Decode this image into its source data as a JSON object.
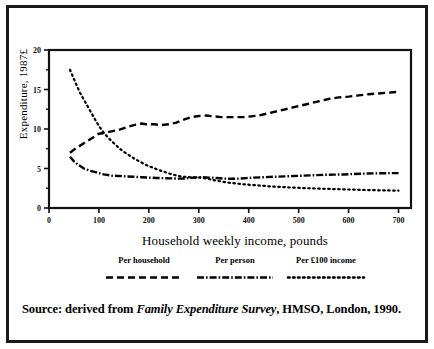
{
  "figure": {
    "source_prefix": "Source: derived from ",
    "source_italic": "Family Expenditure Survey",
    "source_suffix": ", HMSO, London, 1990."
  },
  "legend": {
    "entries": [
      {
        "label": "Per household",
        "dash": "dashed",
        "pattern": "7,4"
      },
      {
        "label": "Per person",
        "dash": "dash-dot",
        "pattern": "7,2,1.6,2"
      },
      {
        "label": "Per £100 income",
        "dash": "dotted",
        "pattern": "1.6,3.4"
      }
    ]
  },
  "chart_data": {
    "type": "line",
    "title": "",
    "xlabel": "Household weekly income, pounds",
    "ylabel": "Expenditure, 1987£",
    "xlim": [
      0,
      725
    ],
    "ylim": [
      0,
      20
    ],
    "grid": false,
    "legend_position": "below-axis",
    "xticks": [
      0,
      100,
      200,
      300,
      400,
      500,
      600,
      700
    ],
    "yticks": [
      0,
      5,
      10,
      15,
      20
    ],
    "yticks_minor": [
      2.5,
      7.5,
      12.5,
      17.5
    ],
    "series": [
      {
        "name": "Per household",
        "style": "dashed",
        "x": [
          42,
          55,
          70,
          85,
          100,
          110,
          125,
          140,
          155,
          170,
          185,
          195,
          210,
          225,
          240,
          255,
          270,
          285,
          300,
          315,
          330,
          345,
          360,
          375,
          390,
          405,
          420,
          440,
          460,
          480,
          500,
          520,
          540,
          560,
          580,
          600,
          620,
          640,
          660,
          680,
          700
        ],
        "y": [
          7.0,
          7.6,
          8.2,
          8.8,
          9.4,
          9.5,
          9.7,
          9.9,
          10.2,
          10.5,
          10.7,
          10.6,
          10.6,
          10.5,
          10.6,
          10.8,
          11.2,
          11.5,
          11.65,
          11.7,
          11.6,
          11.5,
          11.5,
          11.5,
          11.5,
          11.6,
          11.7,
          12.0,
          12.3,
          12.6,
          12.9,
          13.2,
          13.5,
          13.8,
          14.0,
          14.1,
          14.25,
          14.4,
          14.5,
          14.6,
          14.7
        ]
      },
      {
        "name": "Per person",
        "style": "dash-dot",
        "x": [
          42,
          50,
          60,
          70,
          80,
          95,
          110,
          125,
          140,
          155,
          170,
          185,
          200,
          215,
          230,
          245,
          260,
          275,
          290,
          305,
          320,
          335,
          350,
          365,
          380,
          395,
          410,
          430,
          450,
          470,
          490,
          510,
          530,
          550,
          570,
          590,
          610,
          630,
          650,
          670,
          690,
          700
        ],
        "y": [
          6.5,
          5.9,
          5.4,
          5.0,
          4.75,
          4.5,
          4.25,
          4.1,
          4.05,
          4.0,
          3.95,
          3.9,
          3.85,
          3.8,
          3.78,
          3.75,
          3.72,
          3.75,
          3.85,
          3.9,
          3.85,
          3.8,
          3.72,
          3.7,
          3.72,
          3.78,
          3.85,
          3.9,
          3.95,
          4.0,
          4.05,
          4.1,
          4.15,
          4.2,
          4.22,
          4.25,
          4.3,
          4.35,
          4.38,
          4.4,
          4.42,
          4.42
        ]
      },
      {
        "name": "Per £100 income",
        "style": "dotted",
        "x": [
          42,
          48,
          55,
          62,
          70,
          78,
          86,
          94,
          102,
          110,
          120,
          130,
          140,
          150,
          160,
          172,
          184,
          196,
          208,
          220,
          232,
          244,
          256,
          268,
          280,
          292,
          304,
          318,
          332,
          346,
          360,
          375,
          390,
          405,
          420,
          440,
          460,
          480,
          500,
          520,
          540,
          560,
          580,
          600,
          620,
          640,
          660,
          680,
          700
        ],
        "y": [
          17.5,
          16.6,
          15.6,
          14.6,
          13.7,
          12.8,
          11.9,
          11.0,
          10.2,
          9.5,
          8.8,
          8.2,
          7.6,
          7.1,
          6.7,
          6.2,
          5.8,
          5.4,
          5.1,
          4.8,
          4.55,
          4.3,
          4.1,
          3.95,
          3.9,
          3.88,
          3.85,
          3.7,
          3.5,
          3.35,
          3.2,
          3.1,
          3.0,
          2.92,
          2.85,
          2.75,
          2.68,
          2.6,
          2.55,
          2.5,
          2.45,
          2.42,
          2.38,
          2.34,
          2.3,
          2.27,
          2.24,
          2.22,
          2.2
        ]
      }
    ]
  }
}
